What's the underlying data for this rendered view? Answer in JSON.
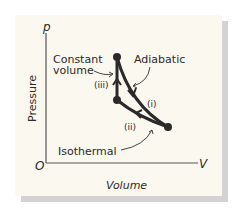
{
  "diagram": {
    "type": "pV cycle diagram",
    "axes": {
      "y_symbol": "p",
      "x_symbol": "V",
      "origin": "O",
      "y_label": "Pressure",
      "x_label": "Volume"
    },
    "annotations": {
      "constant_volume": [
        "Constant",
        "volume"
      ],
      "adiabatic": "Adiabatic",
      "isothermal": "Isothermal"
    },
    "process_labels": {
      "i": "(i)",
      "ii": "(ii)",
      "iii": "(iii)"
    },
    "colors": {
      "panel": "#fbf8ef",
      "shadow": "#d3d3d3",
      "ink": "#2a2a2a"
    }
  }
}
